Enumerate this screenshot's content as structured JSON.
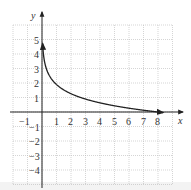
{
  "chart_data": {
    "type": "line",
    "title": "",
    "xlabel": "x",
    "ylabel": "y",
    "xlim": [
      -2,
      9
    ],
    "ylim": [
      -5,
      6
    ],
    "grid": true,
    "x_tick_labels": [
      "-1",
      "1",
      "2",
      "3",
      "4",
      "5",
      "6",
      "7",
      "8"
    ],
    "y_tick_labels": [
      "5",
      "4",
      "3",
      "2",
      "1",
      "-1",
      "-2",
      "-3",
      "-4"
    ],
    "x_ticks": [
      -1,
      1,
      2,
      3,
      4,
      5,
      6,
      7,
      8
    ],
    "y_ticks": [
      5,
      4,
      3,
      2,
      1,
      -1,
      -2,
      -3,
      -4
    ],
    "series": [
      {
        "name": "curve",
        "description": "decreasing logarithmic curve with arrowheads at both ends, crossing x-axis at x=8",
        "x": [
          0.05,
          0.1,
          0.25,
          0.5,
          1,
          2,
          3,
          4,
          5,
          6,
          7,
          8,
          8.3
        ],
        "y": [
          4.6,
          4.0,
          3.15,
          2.52,
          1.89,
          1.26,
          0.89,
          0.63,
          0.43,
          0.26,
          0.12,
          0.0,
          -0.03
        ]
      }
    ]
  },
  "labels": {
    "x_axis": "x",
    "y_axis": "y",
    "x_ticks": [
      "−1",
      "1",
      "2",
      "3",
      "4",
      "5",
      "6",
      "7",
      "8"
    ],
    "y_ticks_pos": [
      "5",
      "4",
      "3",
      "2",
      "1"
    ],
    "y_ticks_neg": [
      "−1",
      "−2",
      "−3",
      "−4"
    ]
  }
}
